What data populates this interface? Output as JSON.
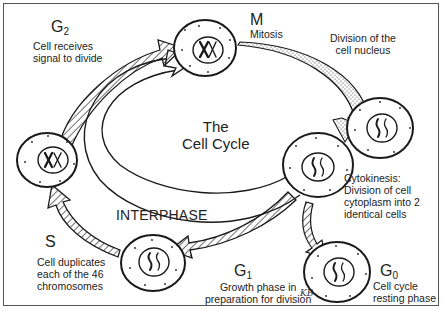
{
  "diagram": {
    "title_line1": "The",
    "title_line2": "Cell Cycle",
    "interphase_label": "INTERPHASE",
    "phases": {
      "g2": {
        "letter": "G",
        "sub": "2",
        "desc_line1": "Cell receives",
        "desc_line2": "signal to divide"
      },
      "m": {
        "letter": "M",
        "sub": "",
        "desc_line1": "Mitosis"
      },
      "division": {
        "desc_line1": "Division of the",
        "desc_line2": "cell nucleus"
      },
      "cytokinesis": {
        "desc_line1": "Cytokinesis:",
        "desc_line2": "Division of cell",
        "desc_line3": "cytoplasm into 2",
        "desc_line4": "identical cells"
      },
      "g0": {
        "letter": "G",
        "sub": "0",
        "desc_line1": "Cell cycle",
        "desc_line2": "resting phase"
      },
      "g1": {
        "letter": "G",
        "sub": "1",
        "desc_line1": "Growth phase in",
        "desc_line2": "preparation for division"
      },
      "s": {
        "letter": "S",
        "sub": "",
        "desc_line1": "Cell duplicates",
        "desc_line2": "each of the 46",
        "desc_line3": "chromosomes"
      }
    },
    "signature": "KB",
    "colors": {
      "ink": "#1a1a1a",
      "background": "#ffffff",
      "border": "#555555"
    }
  }
}
